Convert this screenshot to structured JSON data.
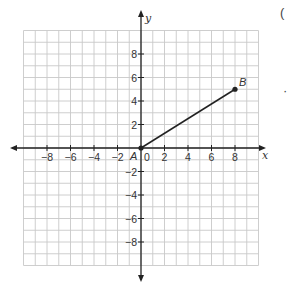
{
  "chart_data": {
    "type": "line",
    "title": "",
    "xlabel": "x",
    "ylabel": "y",
    "xlim": [
      -10,
      10
    ],
    "ylim": [
      -10,
      10
    ],
    "grid": true,
    "x_ticks": [
      -8,
      -6,
      -4,
      -2,
      0,
      2,
      4,
      6,
      8
    ],
    "y_ticks": [
      -8,
      -6,
      -4,
      -2,
      2,
      4,
      6,
      8
    ],
    "x_tick_labels": [
      "−8",
      "−6",
      "−4",
      "−2",
      "0",
      "2",
      "4",
      "6",
      "8"
    ],
    "y_tick_labels": [
      "−8",
      "−6",
      "−4",
      "−2",
      "2",
      "4",
      "6",
      "8"
    ],
    "points": [
      {
        "label": "A",
        "x": 0,
        "y": 0
      },
      {
        "label": "B",
        "x": 8,
        "y": 5
      }
    ],
    "segments": [
      {
        "from": "A",
        "to": "B"
      }
    ]
  },
  "fragments": {
    "top_right_paren": "(",
    "right_dot": "·"
  },
  "colors": {
    "grid": "#c8c8c8",
    "axis": "#222222",
    "segment": "#222222",
    "text": "#333333"
  }
}
